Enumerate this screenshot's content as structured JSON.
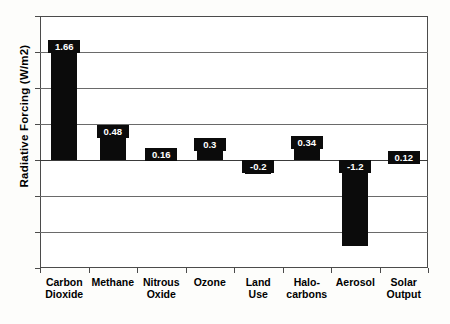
{
  "chart_data": {
    "type": "bar",
    "title": "",
    "xlabel": "",
    "ylabel": "Radiative Forcing (W/m2)",
    "ylim": [
      -1.5,
      2
    ],
    "yticks": [
      "2",
      "1.5",
      "1",
      "0.5",
      "0",
      "-0.5",
      "-1",
      "-1.5"
    ],
    "ytick_values": [
      2,
      1.5,
      1,
      0.5,
      0,
      -0.5,
      -1,
      -1.5
    ],
    "grid": true,
    "legend": "none",
    "orientation": "vertical",
    "bar_color": "#0b0b0b",
    "categories": [
      "Carbon Dioxide",
      "Methane",
      "Nitrous Oxide",
      "Ozone",
      "Land Use",
      "Halo-carbons",
      "Aerosol",
      "Solar Output"
    ],
    "category_lines": [
      [
        "Carbon",
        "Dioxide"
      ],
      [
        "Methane",
        ""
      ],
      [
        "Nitrous",
        "Oxide"
      ],
      [
        "Ozone",
        ""
      ],
      [
        "Land",
        "Use"
      ],
      [
        "Halo-",
        "carbons"
      ],
      [
        "Aerosol",
        ""
      ],
      [
        "Solar",
        "Output"
      ]
    ],
    "values": [
      1.66,
      0.48,
      0.16,
      0.3,
      -0.2,
      0.34,
      -1.2,
      0.12
    ],
    "data_labels": [
      "1.66",
      "0.48",
      "0.16",
      "0.3",
      "-0.2",
      "0.34",
      "-1.2",
      "0.12"
    ]
  }
}
